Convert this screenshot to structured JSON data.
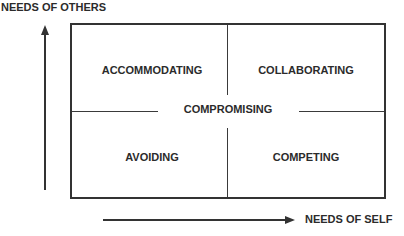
{
  "diagram": {
    "type": "conflict-modes-grid",
    "axes": {
      "y_label": "NEEDS OF OTHERS",
      "x_label": "NEEDS OF SELF"
    },
    "quadrants": {
      "top_left": "ACCOMMODATING",
      "top_right": "COLLABORATING",
      "bottom_left": "AVOIDING",
      "bottom_right": "COMPETING"
    },
    "center": "COMPROMISING",
    "colors": {
      "line": "#333333",
      "text": "#2b2b2b",
      "background": "#ffffff"
    }
  }
}
